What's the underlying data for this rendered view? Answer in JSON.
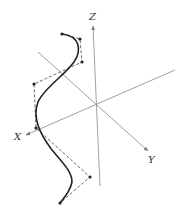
{
  "diagram": {
    "title": "",
    "colors": {
      "axis": "#888888",
      "curve": "#222222",
      "control_polygon": "#444444",
      "label": "#333333"
    },
    "axes": [
      {
        "name": "z-axis",
        "label": "Z"
      },
      {
        "name": "x-axis",
        "label": "X"
      },
      {
        "name": "y-axis",
        "label": "Y"
      }
    ],
    "control_points_count": 8
  }
}
